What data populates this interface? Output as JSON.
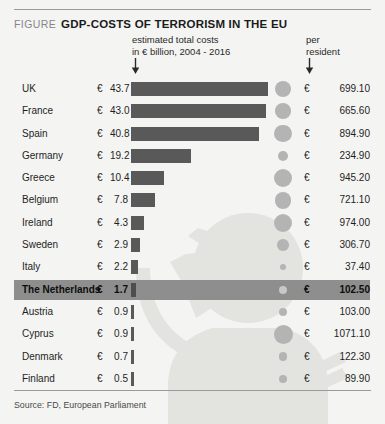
{
  "figure": {
    "label": "FIGURE",
    "title": "GDP-costs of terrorism in the EU",
    "header_left": "estimated total costs\nin € billion, 2004 - 2016",
    "header_left_line1": "estimated total costs",
    "header_left_line2": "in € billion, 2004 - 2016",
    "header_right_line1": "per",
    "header_right_line2": "resident",
    "source": "Source: FD, European Parliament",
    "currency_symbol": "€",
    "arrow_glyph": "down-arrow"
  },
  "colors": {
    "background": "#f4f4f2",
    "bar": "#595959",
    "dot": "#b4b4b4",
    "highlight_band": "#8e8e8e",
    "rule": "#9a9a96",
    "watermark": "#e2e2df",
    "text": "#1f1f1f"
  },
  "chart_data": {
    "type": "bar",
    "title": "GDP-costs of terrorism in the EU",
    "subtitle": "estimated total costs in € billion, 2004 - 2016",
    "xlabel": "",
    "ylabel": "",
    "grid": false,
    "legend": "none",
    "highlighted_category": "The Netherlands",
    "categories": [
      "UK",
      "France",
      "Spain",
      "Germany",
      "Greece",
      "Belgium",
      "Ireland",
      "Sweden",
      "Italy",
      "The Netherlands",
      "Austria",
      "Cyprus",
      "Denmark",
      "Finland"
    ],
    "series": [
      {
        "name": "estimated total costs in € billion, 2004 - 2016",
        "unit": "€ billion",
        "values": [
          43.7,
          43.0,
          40.8,
          19.2,
          10.4,
          7.8,
          4.3,
          2.9,
          2.2,
          1.7,
          0.9,
          0.9,
          0.7,
          0.5
        ],
        "labels": [
          "43.7",
          "43.0",
          "40.8",
          "19.2",
          "10.4",
          "7.8",
          "4.3",
          "2.9",
          "2.2",
          "1.7",
          "0.9",
          "0.9",
          "0.7",
          "0.5"
        ]
      },
      {
        "name": "per resident",
        "unit": "€",
        "encoding": "bubble",
        "values": [
          699.1,
          665.6,
          894.9,
          234.9,
          945.2,
          721.1,
          974.0,
          306.7,
          37.4,
          102.5,
          103.0,
          1071.1,
          122.3,
          89.9
        ],
        "labels": [
          "699.10",
          "665.60",
          "894.90",
          "234.90",
          "945.20",
          "721.10",
          "974.00",
          "306.70",
          "37.40",
          "102.50",
          "103.00",
          "1071.10",
          "122.30",
          "89.90"
        ]
      }
    ],
    "xlim": [
      0,
      43.7
    ],
    "bubble_range": [
      37.4,
      1071.1
    ]
  },
  "rows": [
    {
      "country": "UK",
      "cost": "43.7",
      "per_resident": "699.10",
      "cost_value": 43.7,
      "pr_value": 699.1
    },
    {
      "country": "France",
      "cost": "43.0",
      "per_resident": "665.60",
      "cost_value": 43.0,
      "pr_value": 665.6
    },
    {
      "country": "Spain",
      "cost": "40.8",
      "per_resident": "894.90",
      "cost_value": 40.8,
      "pr_value": 894.9
    },
    {
      "country": "Germany",
      "cost": "19.2",
      "per_resident": "234.90",
      "cost_value": 19.2,
      "pr_value": 234.9
    },
    {
      "country": "Greece",
      "cost": "10.4",
      "per_resident": "945.20",
      "cost_value": 10.4,
      "pr_value": 945.2
    },
    {
      "country": "Belgium",
      "cost": "7.8",
      "per_resident": "721.10",
      "cost_value": 7.8,
      "pr_value": 721.1
    },
    {
      "country": "Ireland",
      "cost": "4.3",
      "per_resident": "974.00",
      "cost_value": 4.3,
      "pr_value": 974.0
    },
    {
      "country": "Sweden",
      "cost": "2.9",
      "per_resident": "306.70",
      "cost_value": 2.9,
      "pr_value": 306.7
    },
    {
      "country": "Italy",
      "cost": "2.2",
      "per_resident": "37.40",
      "cost_value": 2.2,
      "pr_value": 37.4
    },
    {
      "country": "The Netherlands",
      "cost": "1.7",
      "per_resident": "102.50",
      "cost_value": 1.7,
      "pr_value": 102.5,
      "highlight": true
    },
    {
      "country": "Austria",
      "cost": "0.9",
      "per_resident": "103.00",
      "cost_value": 0.9,
      "pr_value": 103.0
    },
    {
      "country": "Cyprus",
      "cost": "0.9",
      "per_resident": "1071.10",
      "cost_value": 0.9,
      "pr_value": 1071.1
    },
    {
      "country": "Denmark",
      "cost": "0.7",
      "per_resident": "122.30",
      "cost_value": 0.7,
      "pr_value": 122.3
    },
    {
      "country": "Finland",
      "cost": "0.5",
      "per_resident": "89.90",
      "cost_value": 0.5,
      "pr_value": 89.9
    }
  ]
}
